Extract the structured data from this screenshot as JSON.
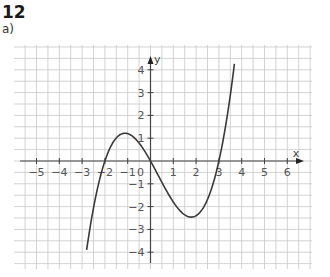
{
  "header": {
    "task_number": "12",
    "subtask": "a)"
  },
  "colors": {
    "grid": "#c8c8c8",
    "axis": "#444444",
    "curve": "#3a3a3a",
    "text": "#1a1a1a"
  },
  "chart_data": {
    "type": "line",
    "title": "",
    "xlabel": "x",
    "ylabel": "y",
    "xlim": [
      -5.9,
      7.0
    ],
    "ylim": [
      -4.7,
      5.0
    ],
    "x_ticks": [
      -5,
      -4,
      -3,
      -2,
      -1,
      1,
      2,
      3,
      4,
      5,
      6
    ],
    "x_tick_labels": [
      "−5",
      "−4",
      "−3",
      "−2",
      "−1",
      "1",
      "2",
      "3",
      "4",
      "5",
      "6"
    ],
    "y_ticks": [
      -4,
      -3,
      -2,
      -1,
      1,
      2,
      3,
      4
    ],
    "y_tick_labels": [
      "−4",
      "−3",
      "−2",
      "−1",
      "1",
      "2",
      "3",
      "4"
    ],
    "origin_label": "0",
    "grid": true,
    "grid_step": 0.5,
    "series": [
      {
        "name": "f(x) ≈ 0.3·x(x+2)(x−3)",
        "x": [
          -2.8,
          -2.5,
          -2.0,
          -1.5,
          -1.12,
          -0.5,
          0.0,
          0.5,
          1.0,
          1.5,
          1.79,
          2.0,
          2.5,
          3.0,
          3.3,
          3.68
        ],
        "y": [
          -3.9,
          -2.06,
          0.0,
          1.01,
          1.22,
          0.79,
          0.0,
          -0.94,
          -1.8,
          -2.36,
          -2.46,
          -2.4,
          -1.69,
          0.0,
          1.31,
          4.26
        ]
      }
    ],
    "key_points": {
      "roots": [
        -2,
        0,
        3
      ],
      "local_max": [
        -1.1,
        1.2
      ],
      "local_min": [
        1.8,
        -2.5
      ]
    }
  }
}
